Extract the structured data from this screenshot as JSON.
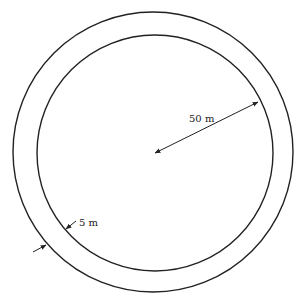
{
  "diagram": {
    "type": "annular ring (two concentric circles)",
    "outer_circle": {
      "cx": 153,
      "cy": 152,
      "r": 140
    },
    "inner_circle": {
      "cx": 155,
      "cy": 153,
      "r": 118
    },
    "labels": {
      "radius": "50 m",
      "ring_width": "5 m"
    },
    "radius_arrow": {
      "from": [
        155,
        153
      ],
      "to": [
        258,
        102
      ]
    },
    "width_arrows": {
      "outer": {
        "from": [
          33,
          252
        ],
        "to": [
          46,
          245
        ]
      },
      "inner": {
        "from": [
          76,
          221
        ],
        "to": [
          66,
          229
        ]
      }
    },
    "colors": {
      "stroke": "#222222",
      "background": "#ffffff"
    }
  }
}
